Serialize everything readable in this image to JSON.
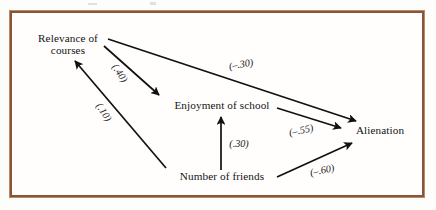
{
  "figure": {
    "border_color": "#8a5536",
    "background": "#fffefd",
    "width": 436,
    "height": 210
  },
  "chart_data": {
    "type": "diagram",
    "title": "",
    "nodes": [
      {
        "id": "relevance",
        "label_line1": "Relevance of",
        "label_line2": "courses",
        "x": 68,
        "y": 44
      },
      {
        "id": "enjoyment",
        "label_line1": "Enjoyment of school",
        "label_line2": "",
        "x": 222,
        "y": 105
      },
      {
        "id": "alienation",
        "label_line1": "Alienation",
        "label_line2": "",
        "x": 380,
        "y": 130
      },
      {
        "id": "friends",
        "label_line1": "Number of friends",
        "label_line2": "",
        "x": 222,
        "y": 176
      }
    ],
    "edges": [
      {
        "id": "relevance-to-alienation",
        "from": "relevance",
        "to": "alienation",
        "coefficient": "(–.30)",
        "coef_x": 241,
        "coef_y": 64,
        "coef_rotate": -9,
        "x1": 108,
        "y1": 39,
        "x2": 356,
        "y2": 121
      },
      {
        "id": "relevance-to-enjoyment",
        "from": "relevance",
        "to": "enjoyment",
        "coefficient": "(.40)",
        "coef_x": 120,
        "coef_y": 73,
        "coef_rotate": 56,
        "x1": 104,
        "y1": 46,
        "x2": 159,
        "y2": 95
      },
      {
        "id": "friends-to-relevance",
        "from": "friends",
        "to": "relevance",
        "coefficient": "(.10)",
        "coef_x": 104,
        "coef_y": 112,
        "coef_rotate": 56,
        "x1": 166,
        "y1": 168,
        "x2": 75,
        "y2": 61
      },
      {
        "id": "friends-to-enjoyment",
        "from": "friends",
        "to": "enjoyment",
        "coefficient": "(.30)",
        "coef_x": 239,
        "coef_y": 143,
        "coef_rotate": 0,
        "x1": 221,
        "y1": 170,
        "x2": 221,
        "y2": 117
      },
      {
        "id": "enjoyment-to-alienation",
        "from": "enjoyment",
        "to": "alienation",
        "coefficient": "(–.55)",
        "coef_x": 301,
        "coef_y": 130,
        "coef_rotate": -12,
        "x1": 277,
        "y1": 108,
        "x2": 341,
        "y2": 128
      },
      {
        "id": "friends-to-alienation",
        "from": "friends",
        "to": "alienation",
        "coefficient": "(–.60)",
        "coef_x": 322,
        "coef_y": 170,
        "coef_rotate": -12,
        "x1": 277,
        "y1": 177,
        "x2": 352,
        "y2": 143
      }
    ]
  }
}
